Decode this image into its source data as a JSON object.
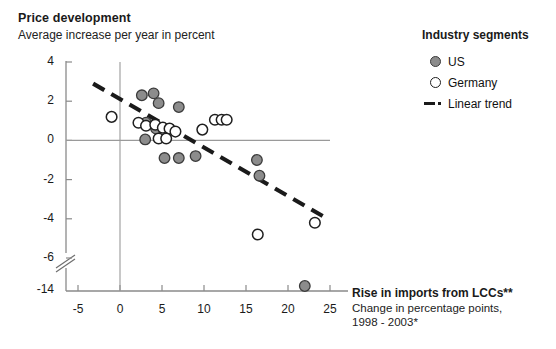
{
  "header": {
    "title": "Price development",
    "subtitle": "Average increase per year in percent"
  },
  "legend": {
    "title": "Industry segments",
    "items": [
      {
        "label": "US",
        "marker": "filled-circle-icon",
        "color": "#8c8c8c"
      },
      {
        "label": "Germany",
        "marker": "open-circle-icon",
        "color": "#ffffff"
      },
      {
        "label": "Linear trend",
        "marker": "dashed-line-icon",
        "color": "#1a1a1a"
      }
    ]
  },
  "xaxis_caption": {
    "title": "Rise in imports from LCCs**",
    "line1": "Change in percentage points,",
    "line2": "1998 - 2003*"
  },
  "chart_data": {
    "type": "scatter",
    "title": "Price development",
    "subtitle": "Average increase per year in percent",
    "xlabel": "Rise in imports from LCCs**",
    "ylabel": "Average increase per year in percent",
    "xlim": [
      -5,
      25
    ],
    "ylim": [
      -14,
      4
    ],
    "xticks": [
      -5,
      0,
      5,
      10,
      15,
      20,
      25
    ],
    "yticks": [
      4,
      2,
      0,
      -2,
      -4,
      -6,
      -14
    ],
    "y_axis_break_between": [
      -6,
      -14
    ],
    "grid": false,
    "zero_lines": {
      "horizontal_y": 0,
      "vertical_x": 0
    },
    "legend_position": "top-right",
    "series": [
      {
        "name": "US",
        "marker": "filled-circle",
        "color": "#8c8c8c",
        "edge_color": "#3b3b3b",
        "points": [
          [
            2.6,
            2.3
          ],
          [
            4.0,
            2.4
          ],
          [
            4.6,
            1.9
          ],
          [
            7.0,
            1.7
          ],
          [
            3.1,
            0.9
          ],
          [
            4.3,
            0.6
          ],
          [
            3.0,
            0.05
          ],
          [
            5.3,
            -0.9
          ],
          [
            7.0,
            -0.9
          ],
          [
            9.0,
            -0.8
          ],
          [
            16.3,
            -1.0
          ],
          [
            16.6,
            -1.8
          ],
          [
            22.0,
            -13.0
          ]
        ]
      },
      {
        "name": "Germany",
        "marker": "open-circle",
        "color": "#ffffff",
        "edge_color": "#1f1f1f",
        "points": [
          [
            -1.0,
            1.2
          ],
          [
            2.2,
            0.9
          ],
          [
            3.1,
            0.75
          ],
          [
            4.2,
            0.8
          ],
          [
            5.1,
            0.65
          ],
          [
            5.9,
            0.6
          ],
          [
            6.6,
            0.45
          ],
          [
            4.6,
            0.1
          ],
          [
            5.5,
            0.1
          ],
          [
            9.8,
            0.55
          ],
          [
            11.3,
            1.05
          ],
          [
            12.1,
            1.05
          ],
          [
            12.7,
            1.05
          ],
          [
            16.4,
            -4.8
          ],
          [
            23.2,
            -4.2
          ]
        ]
      }
    ],
    "trend": {
      "name": "Linear trend",
      "style": "dashed",
      "color": "#1a1a1a",
      "x_start": -3.2,
      "y_start": 2.9,
      "x_end": 24.3,
      "y_end": -3.9
    }
  }
}
